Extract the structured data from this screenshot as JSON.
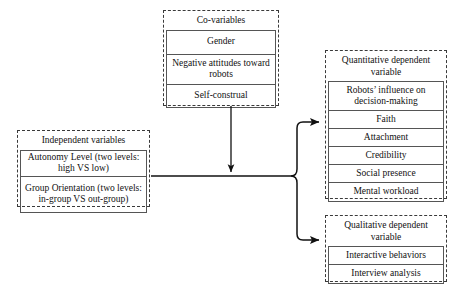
{
  "diagram": {
    "boxes": {
      "covariables": {
        "title": "Co-variables",
        "items": [
          "Gender",
          "Negative attitudes toward robots",
          "Self-construal"
        ]
      },
      "independent": {
        "title": "Independent variables",
        "items": [
          "Autonomy Level (two levels: high VS low)",
          "Group Orientation (two levels: in-group VS out-group)"
        ]
      },
      "quantitative": {
        "title": "Quantitative dependent variable",
        "items": [
          "Robots’ influence on decision-making",
          "Faith",
          "Attachment",
          "Credibility",
          "Social presence",
          "Mental workload"
        ]
      },
      "qualitative": {
        "title": "Qualitative dependent variable",
        "items": [
          "Interactive behaviors",
          "Interview analysis"
        ]
      }
    },
    "connectors": [
      {
        "name": "covariables-to-main-path",
        "from": "covariables",
        "to": "main-path",
        "style": "arrow-down"
      },
      {
        "name": "independent-to-quantitative",
        "from": "independent",
        "to": "quantitative",
        "style": "arrow-right"
      },
      {
        "name": "independent-to-qualitative",
        "from": "independent",
        "to": "qualitative",
        "style": "arrow-right"
      }
    ],
    "colors": {
      "line": "#111111",
      "dashed_border": "#3a3a3a",
      "cell_border": "#555555",
      "background": "#ffffff",
      "text": "#111111"
    }
  }
}
